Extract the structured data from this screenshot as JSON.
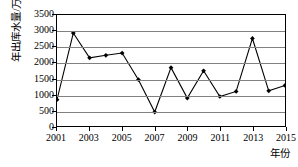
{
  "chart_data": {
    "type": "line",
    "title": "",
    "xlabel": "年份",
    "ylabel": "年出库水量/万 m³",
    "ylabel_text": "年出库水量/万 m",
    "ylabel_sup": "3",
    "x": [
      2001,
      2002,
      2003,
      2004,
      2005,
      2006,
      2007,
      2008,
      2009,
      2010,
      2011,
      2012,
      2013,
      2014,
      2015
    ],
    "values": [
      830,
      2930,
      2150,
      2230,
      2300,
      1460,
      440,
      1840,
      880,
      1740,
      930,
      1090,
      2760,
      1110,
      1280
    ],
    "series": [
      {
        "name": "年出库水量",
        "values": [
          830,
          2930,
          2150,
          2230,
          2300,
          1460,
          440,
          1840,
          880,
          1740,
          930,
          1090,
          2760,
          1110,
          1280
        ]
      }
    ],
    "xlim": [
      2001,
      2015
    ],
    "ylim": [
      0,
      3500
    ],
    "ytick_values": [
      0,
      500,
      1000,
      1500,
      2000,
      2500,
      3000,
      3500
    ],
    "ytick_labels": [
      "0",
      "500",
      "1000",
      "1500",
      "2000",
      "2500",
      "3000",
      "3500"
    ],
    "xtick_values": [
      2001,
      2003,
      2005,
      2007,
      2009,
      2011,
      2013,
      2015
    ],
    "xtick_labels": [
      "2001",
      "2003",
      "2005",
      "2007",
      "2009",
      "2011",
      "2013",
      "2015"
    ],
    "grid": "horizontal",
    "legend": "none",
    "line_color": "#000000",
    "marker": "diamond",
    "marker_color": "#000000",
    "gridline_color": "#808080",
    "axis_color": "#000000",
    "background": "#ffffff"
  }
}
